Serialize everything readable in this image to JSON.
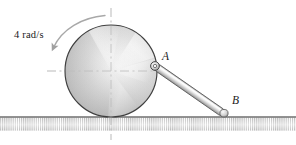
{
  "figure": {
    "type": "mechanics-diagram",
    "background": "#ffffff"
  },
  "labels": {
    "angular_velocity": "4 rad/s",
    "point_a": "A",
    "point_b": "B"
  },
  "colors": {
    "outline": "#3a3a3a",
    "ground_line": "#6e6e6e",
    "hatch": "#9a9a9a",
    "disk_light": "#ffffff",
    "disk_mid": "#d8d8d8",
    "disk_dark": "#b4b4b4",
    "rod_light": "#f2f2f2",
    "rod_mid": "#c9c9c9",
    "rod_dark": "#8f8f8f",
    "centerline": "#b9b9b9",
    "arrow": "#a8a8a8",
    "text": "#1a1a1a"
  },
  "geometry": {
    "disk": {
      "cx": 111,
      "cy": 71,
      "r": 46,
      "units": "px"
    },
    "point_a": {
      "x": 155,
      "y": 66
    },
    "point_b": {
      "x": 224,
      "y": 114
    },
    "ground_y": 117,
    "rod_thickness": 7,
    "centerline_horizontal": {
      "x1": 47,
      "x2": 156,
      "y": 71
    },
    "centerline_vertical": {
      "x": 111,
      "y1": 8,
      "y2": 140
    },
    "spin_arrow": {
      "start": {
        "x": 104,
        "y": 16
      },
      "end": {
        "x": 54,
        "y": 49
      },
      "direction": "counterclockwise-sweep-to-lower-left"
    }
  }
}
